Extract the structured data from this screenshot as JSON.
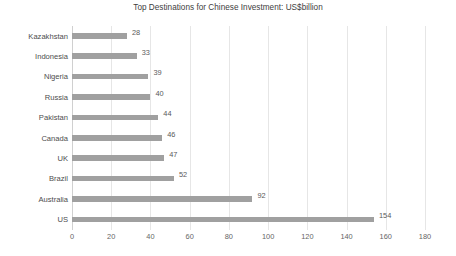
{
  "chart_data": {
    "type": "bar",
    "orientation": "horizontal",
    "title": "Top Destinations for Chinese Investment: US$billion",
    "xlabel": "",
    "ylabel": "",
    "xlim": [
      0,
      180
    ],
    "ylim": null,
    "grid": true,
    "legend": false,
    "legend_position": "none",
    "xticks": [
      0,
      20,
      40,
      60,
      80,
      100,
      120,
      140,
      160,
      180
    ],
    "categories": [
      "Kazakhstan",
      "Indonesia",
      "Nigeria",
      "Russia",
      "Pakistan",
      "Canada",
      "UK",
      "Brazil",
      "Australia",
      "US"
    ],
    "values": [
      28,
      33,
      39,
      40,
      44,
      46,
      47,
      52,
      92,
      154
    ],
    "data_labels": [
      "28",
      "33",
      "39",
      "40",
      "44",
      "46",
      "47",
      "52",
      "92",
      "154"
    ],
    "series": [
      {
        "name": "US$billion",
        "values": [
          28,
          33,
          39,
          40,
          44,
          46,
          47,
          52,
          92,
          154
        ]
      }
    ],
    "colors": {
      "bar": "#a0a0a0",
      "gridline": "#e6e6e6",
      "axis": "#d0d0d0",
      "title_text": "#404040",
      "label_text": "#4d4d4d",
      "tick_text": "#666666",
      "value_text": "#595959",
      "background": "#ffffff"
    }
  }
}
